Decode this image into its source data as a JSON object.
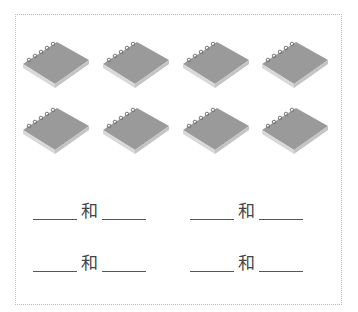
{
  "worksheet": {
    "images": {
      "count": 8,
      "rows": 2,
      "cols": 4,
      "item": "notebook-icon"
    },
    "prompts": [
      {
        "conj": "和"
      },
      {
        "conj": "和"
      },
      {
        "conj": "和"
      },
      {
        "conj": "和"
      }
    ]
  }
}
